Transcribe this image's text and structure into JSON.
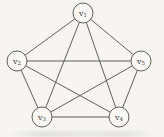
{
  "colors": {
    "background": "#f6f5f2",
    "edge_stroke": "#4f4e49",
    "node_fill": "#f9f8f5",
    "node_stroke": "#4f4e49",
    "label_color": "#3c3b37"
  },
  "graph": {
    "node_radius": 10,
    "edge_stroke_width": 0.9,
    "node_stroke_width": 0.9,
    "nodes": [
      {
        "id": "v1",
        "base": "v",
        "sub": "1",
        "x": 83,
        "y": 13
      },
      {
        "id": "v2",
        "base": "v",
        "sub": "2",
        "x": 17,
        "y": 61
      },
      {
        "id": "v3",
        "base": "v",
        "sub": "3",
        "x": 42,
        "y": 117
      },
      {
        "id": "v4",
        "base": "v",
        "sub": "4",
        "x": 119,
        "y": 117
      },
      {
        "id": "v5",
        "base": "v",
        "sub": "5",
        "x": 141,
        "y": 61
      }
    ],
    "edges": [
      [
        "v1",
        "v2"
      ],
      [
        "v1",
        "v5"
      ],
      [
        "v2",
        "v3"
      ],
      [
        "v3",
        "v4"
      ],
      [
        "v4",
        "v5"
      ],
      [
        "v1",
        "v3"
      ],
      [
        "v1",
        "v4"
      ],
      [
        "v2",
        "v4"
      ],
      [
        "v2",
        "v5"
      ],
      [
        "v3",
        "v5"
      ]
    ]
  }
}
